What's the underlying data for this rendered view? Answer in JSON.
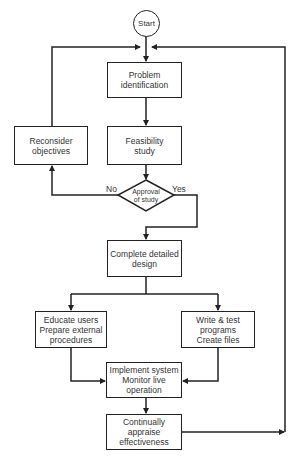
{
  "diagram": {
    "type": "flowchart",
    "nodes": {
      "start": {
        "label": "Start",
        "shape": "circle"
      },
      "problem": {
        "label": "Problem\nidentification",
        "shape": "rect"
      },
      "feasibility": {
        "label": "Feasibility\nstudy",
        "shape": "rect"
      },
      "reconsider": {
        "label": "Reconsider\nobjectives",
        "shape": "rect"
      },
      "approval": {
        "label": "Approval\nof study",
        "shape": "diamond"
      },
      "design": {
        "label": "Complete detailed\ndesign",
        "shape": "rect"
      },
      "educate": {
        "label": "Educate users\nPrepare external\nprocedures",
        "shape": "rect"
      },
      "write": {
        "label": "Write & test\nprograms\nCreate files",
        "shape": "rect"
      },
      "implement": {
        "label": "Implement system\nMonitor live\noperation",
        "shape": "rect"
      },
      "appraise": {
        "label": "Continually\nappraise\neffectiveness",
        "shape": "rect"
      }
    },
    "edge_labels": {
      "no": "No",
      "yes": "Yes"
    },
    "edges": [
      {
        "from": "start",
        "to": "problem"
      },
      {
        "from": "problem",
        "to": "feasibility"
      },
      {
        "from": "feasibility",
        "to": "approval"
      },
      {
        "from": "approval",
        "to": "reconsider",
        "label": "No"
      },
      {
        "from": "reconsider",
        "to": "problem"
      },
      {
        "from": "approval",
        "to": "design",
        "label": "Yes"
      },
      {
        "from": "design",
        "to": "educate"
      },
      {
        "from": "design",
        "to": "write"
      },
      {
        "from": "educate",
        "to": "implement"
      },
      {
        "from": "write",
        "to": "implement"
      },
      {
        "from": "implement",
        "to": "appraise"
      },
      {
        "from": "appraise",
        "to": "problem"
      }
    ],
    "colors": {
      "line": "#222222",
      "text": "#333333",
      "background": "#ffffff"
    }
  }
}
